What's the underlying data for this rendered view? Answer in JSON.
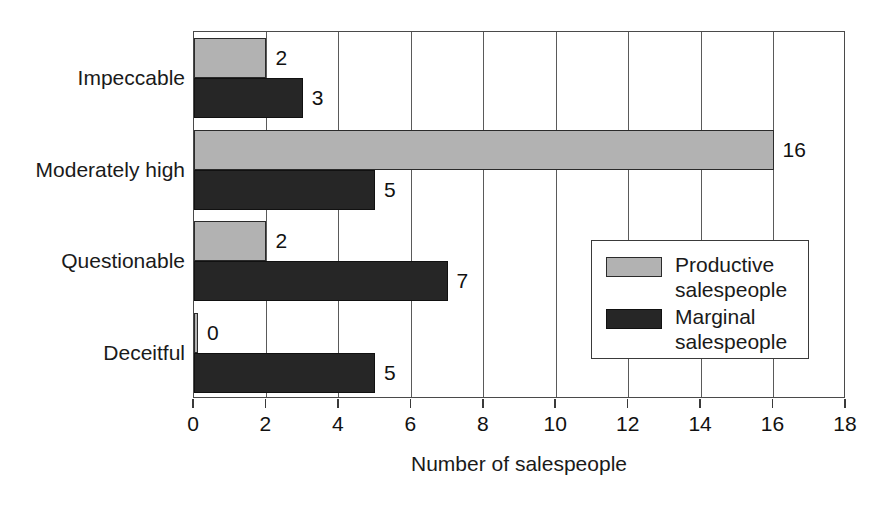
{
  "chart_data": {
    "type": "bar",
    "orientation": "horizontal",
    "title": "",
    "xlabel": "Number of salespeople",
    "ylabel": "",
    "xlim": [
      0,
      18
    ],
    "xticks": [
      0,
      2,
      4,
      6,
      8,
      10,
      12,
      14,
      16,
      18
    ],
    "xtick_labels": [
      "0",
      "2",
      "4",
      "6",
      "8",
      "10",
      "12",
      "14",
      "16",
      "18"
    ],
    "grid": true,
    "grid_axis": "x",
    "legend_position": "inside-right-lower",
    "categories": [
      "Impeccable",
      "Moderately high",
      "Questionable",
      "Deceitful"
    ],
    "series": [
      {
        "name": "Productive salespeople",
        "color": "#b2b2b2",
        "values": [
          2,
          16,
          2,
          0
        ],
        "value_labels": [
          "2",
          "16",
          "2",
          "0"
        ]
      },
      {
        "name": "Marginal salespeople",
        "color": "#262626",
        "values": [
          3,
          5,
          7,
          5
        ],
        "value_labels": [
          "3",
          "5",
          "7",
          "5"
        ]
      }
    ]
  },
  "legend": {
    "entries": [
      {
        "label": "Productive\nsalespeople",
        "swatch": "productive"
      },
      {
        "label": "Marginal\nsalespeople",
        "swatch": "marginal"
      }
    ]
  },
  "colors": {
    "productive": "#b2b2b2",
    "marginal": "#262626",
    "axis": "#4a4a4a",
    "grid": "#5a5a5a",
    "text": "#1a1a1a",
    "background": "#ffffff"
  }
}
